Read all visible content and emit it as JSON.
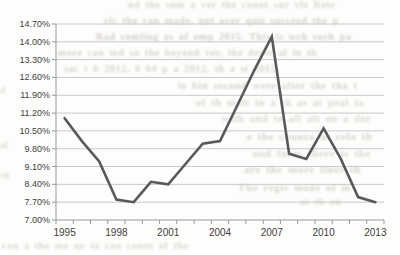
{
  "chart_data": {
    "type": "line",
    "title": "",
    "xlabel": "",
    "ylabel": "",
    "x": [
      1995,
      1996,
      1997,
      1998,
      1999,
      2000,
      2001,
      2002,
      2003,
      2004,
      2005,
      2006,
      2007,
      2008,
      2009,
      2010,
      2011,
      2012,
      2013
    ],
    "series": [
      {
        "name": "rate-percent",
        "values": [
          11.0,
          10.1,
          9.3,
          7.8,
          7.7,
          8.5,
          8.4,
          9.2,
          10.0,
          10.1,
          11.5,
          12.9,
          14.2,
          9.6,
          9.4,
          10.6,
          9.4,
          7.9,
          7.7
        ]
      }
    ],
    "y_tick_labels": [
      "14.70%",
      "14.00%",
      "13.30%",
      "12.60%",
      "11.90%",
      "11.20%",
      "10.50%",
      "9.80%",
      "9.10%",
      "8.40%",
      "7.70%",
      "7.00%"
    ],
    "x_tick_labels": [
      "1995",
      "1998",
      "2001",
      "2004",
      "2007",
      "2010",
      "2013"
    ],
    "x_label_step_years": 3,
    "ylim": [
      7.0,
      14.7
    ],
    "y_step": 0.7,
    "grid": true,
    "legend": "none",
    "colors": {
      "line": "#595959",
      "gridline": "#c9c9c9",
      "axis": "#999999",
      "tick_label": "#3d3d3d",
      "paper": "#fdfdfc",
      "bleed_text": "#a89f92"
    }
  },
  "background": {
    "fragments": [
      {
        "x": 128,
        "y": -1,
        "size": 10,
        "opacity": 0.42,
        "text": "nd the sum a ver the count sur vle Rete"
      },
      {
        "x": 104,
        "y": 15,
        "size": 10,
        "opacity": 0.5,
        "text": "ric the can made, not over quit succeed the p"
      },
      {
        "x": 96,
        "y": 31,
        "size": 10,
        "opacity": 0.5,
        "text": "Rad comling as of emp 2015. This is wch such pa"
      },
      {
        "x": 58,
        "y": 47,
        "size": 10,
        "opacity": 0.45,
        "text": "more can ted so the beyond ver, the deriv al in th"
      },
      {
        "x": 64,
        "y": 63,
        "size": 10,
        "opacity": 0.45,
        "text": "sac t b 2012, 0 64 p a 2012, th a si 2012,"
      },
      {
        "x": 178,
        "y": 80,
        "size": 10.5,
        "opacity": 0.45,
        "text": "le bin second were alter the tha t"
      },
      {
        "x": 196,
        "y": 97,
        "size": 10.5,
        "opacity": 0.42,
        "text": "of th molt in a th as at peal to"
      },
      {
        "x": 222,
        "y": 113,
        "size": 10.5,
        "opacity": 0.42,
        "text": "with and to all alt on a der"
      },
      {
        "x": 246,
        "y": 130,
        "size": 11,
        "opacity": 0.45,
        "text": "a the counta at rela th"
      },
      {
        "x": 252,
        "y": 147,
        "size": 11,
        "opacity": 0.42,
        "text": "and form there is the"
      },
      {
        "x": 244,
        "y": 163,
        "size": 11,
        "opacity": 0.45,
        "text": "are the more lines th"
      },
      {
        "x": 238,
        "y": 181,
        "size": 11,
        "opacity": 0.45,
        "text": "The regis ment of m"
      },
      {
        "x": 300,
        "y": 196,
        "size": 10,
        "opacity": 0.4,
        "text": "at th on"
      },
      {
        "x": 2,
        "y": 240,
        "size": 10,
        "opacity": 0.4,
        "text": "can a the me ne to can count of the"
      },
      {
        "x": 0,
        "y": 85,
        "size": 9,
        "opacity": 0.4,
        "text": "d"
      },
      {
        "x": 0,
        "y": 140,
        "size": 9,
        "opacity": 0.4,
        "text": "al"
      },
      {
        "x": 1,
        "y": 170,
        "size": 9,
        "opacity": 0.4,
        "text": "th"
      }
    ]
  }
}
